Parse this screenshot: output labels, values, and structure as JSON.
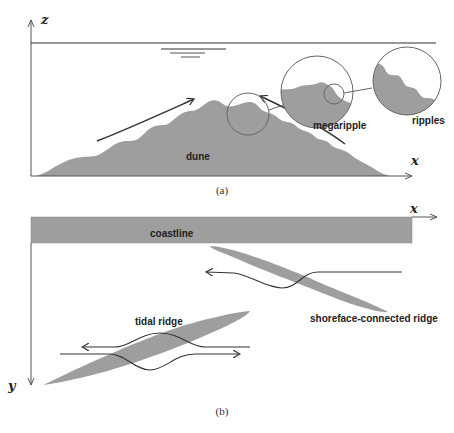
{
  "panel_a": {
    "caption": "(a)",
    "axis_vertical": "z",
    "axis_horizontal": "x",
    "labels": {
      "dune": "dune",
      "megaripple": "megaripple",
      "ripples": "ripples"
    }
  },
  "panel_b": {
    "caption": "(b)",
    "axis_vertical": "y",
    "axis_horizontal": "x",
    "labels": {
      "coastline": "coastline",
      "tidal_ridge": "tidal ridge",
      "shoreface_ridge": "shoreface-connected ridge"
    }
  },
  "colors": {
    "sediment": "#9e9e9e",
    "line": "#333333",
    "background": "#ffffff"
  }
}
